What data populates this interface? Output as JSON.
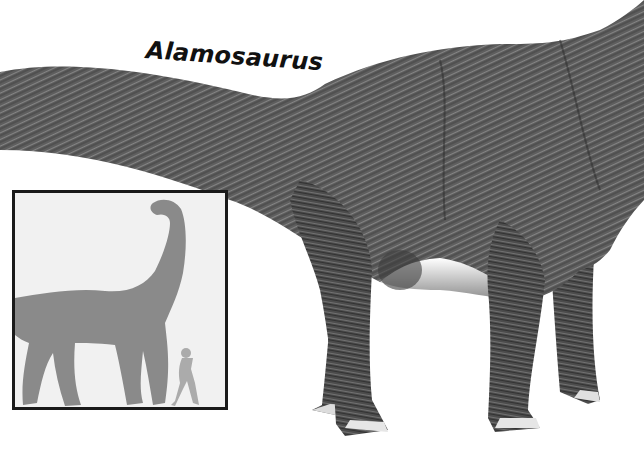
{
  "page": {
    "background": "#ffffff"
  },
  "title": {
    "text": "Alamosaurus"
  },
  "illustration": {
    "subject": "Alamosaurus sauropod dinosaur",
    "style": "grayscale pen-and-ink texture",
    "body_color": "#5e5e5e",
    "shadow_color": "#2e2e2e",
    "highlight_color": "#9a9a9a"
  },
  "size_comparison_inset": {
    "background": "#f1f1f1",
    "border_color": "#1a1a1a",
    "dinosaur_silhouette_color": "#8a8a8a",
    "human_silhouette_color": "#ababab",
    "figures": [
      "dinosaur-silhouette",
      "human-silhouette"
    ]
  }
}
